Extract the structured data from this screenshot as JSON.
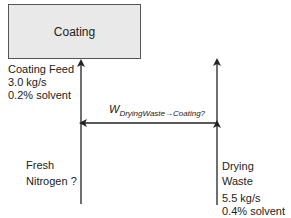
{
  "process_box": {
    "label": "Coating",
    "fill": "#e9e9e9"
  },
  "streams": {
    "coating_feed": {
      "name": "Coating Feed",
      "rate": "3.0 kg/s",
      "composition": "0.2% solvent"
    },
    "fresh_nitrogen": {
      "line1": "Fresh",
      "line2": "Nitrogen ?"
    },
    "drying_waste": {
      "line1": "Drying",
      "line2": "Waste",
      "rate": "5.5 kg/s",
      "composition": "0.4% solvent"
    },
    "recycle": {
      "symbol": "W",
      "subscript": "DryingWaste→Coating?"
    }
  }
}
